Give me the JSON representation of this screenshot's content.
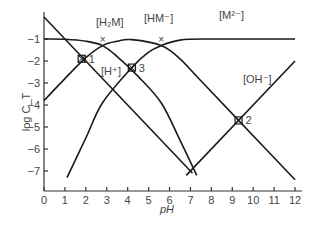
{
  "chart_data": {
    "type": "line",
    "title": "",
    "xlabel": "pH",
    "ylabel": "log C_T",
    "xlim": [
      0,
      12.5
    ],
    "ylim": [
      -7.8,
      0.3
    ],
    "x_ticks": [
      "0",
      "1",
      "2",
      "3",
      "4",
      "5",
      "6",
      "7",
      "8",
      "9",
      "10",
      "11",
      "12"
    ],
    "y_ticks": [
      "-1",
      "-2",
      "-3",
      "-4",
      "-5",
      "-6",
      "-7"
    ],
    "grid": false,
    "series": [
      {
        "name": "[H2M]",
        "label": "[H₂M]",
        "points": [
          [
            0,
            -1.0
          ],
          [
            1,
            -1.01
          ],
          [
            2,
            -1.1
          ],
          [
            2.8,
            -1.3
          ],
          [
            3.5,
            -1.8
          ],
          [
            4.5,
            -2.7
          ],
          [
            5.6,
            -3.9
          ],
          [
            6.5,
            -5.6
          ],
          [
            7.3,
            -7.2
          ]
        ]
      },
      {
        "name": "[HM-]",
        "label": "[HM⁻]",
        "points": [
          [
            0,
            -3.8
          ],
          [
            1,
            -2.8
          ],
          [
            2,
            -1.85
          ],
          [
            2.8,
            -1.3
          ],
          [
            3.5,
            -1.1
          ],
          [
            4.2,
            -1.03
          ],
          [
            5.6,
            -1.3
          ],
          [
            6.5,
            -1.9
          ],
          [
            7.5,
            -2.9
          ],
          [
            9.3,
            -4.7
          ],
          [
            12,
            -7.4
          ]
        ]
      },
      {
        "name": "[M2-]",
        "label": "[M²⁻]",
        "points": [
          [
            1.1,
            -7.3
          ],
          [
            2,
            -5.5
          ],
          [
            2.8,
            -3.9
          ],
          [
            4.2,
            -2.3
          ],
          [
            5.0,
            -1.6
          ],
          [
            5.6,
            -1.3
          ],
          [
            6.5,
            -1.05
          ],
          [
            8,
            -1.0
          ],
          [
            12,
            -1.0
          ]
        ]
      },
      {
        "name": "[H+]",
        "label": "[H⁺]",
        "points": [
          [
            0,
            0
          ],
          [
            7.1,
            -7.1
          ]
        ]
      },
      {
        "name": "[OH-]",
        "label": "[OH⁻]",
        "points": [
          [
            6.8,
            -7.2
          ],
          [
            12,
            -2.0
          ]
        ]
      }
    ],
    "annotations": [
      {
        "text": "1",
        "type": "point",
        "x": 1.8,
        "y": -1.9
      },
      {
        "text": "2",
        "type": "point",
        "x": 9.3,
        "y": -4.7
      },
      {
        "text": "3",
        "type": "point",
        "x": 4.2,
        "y": -2.3
      },
      {
        "text": "×",
        "type": "marker",
        "x": 2.8,
        "y": -1.3
      },
      {
        "text": "×",
        "type": "marker",
        "x": 5.6,
        "y": -1.3
      }
    ],
    "labels": {
      "h2m": "[H₂M]",
      "hm": "[HM⁻]",
      "m2": "[M²⁻]",
      "h": "[H⁺]",
      "oh": "[OH⁻]"
    }
  }
}
